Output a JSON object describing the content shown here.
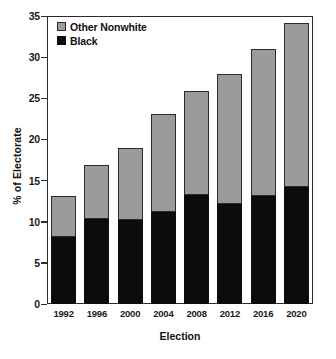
{
  "chart_data": {
    "type": "bar",
    "stacked": true,
    "title": "",
    "xlabel": "Election",
    "ylabel": "% of Electorate",
    "categories": [
      "1992",
      "1996",
      "2000",
      "2004",
      "2008",
      "2012",
      "2016",
      "2020"
    ],
    "series": [
      {
        "name": "Black",
        "color": "#0c0c0c",
        "values": [
          8.2,
          10.3,
          10.2,
          11.2,
          13.2,
          12.2,
          13.1,
          14.2
        ]
      },
      {
        "name": "Other Nonwhite",
        "color": "#9b9b9b",
        "values": [
          4.9,
          6.6,
          8.8,
          11.9,
          12.7,
          15.8,
          17.9,
          19.9
        ]
      }
    ],
    "totals": [
      13.1,
      16.9,
      19.0,
      23.1,
      25.9,
      28.0,
      31.0,
      34.1
    ],
    "ylim": [
      0,
      35
    ],
    "yticks": [
      0,
      5,
      10,
      15,
      20,
      25,
      30,
      35
    ],
    "ytick_labels": [
      "0",
      "5",
      "10",
      "15",
      "20",
      "25",
      "30",
      "35"
    ],
    "grid": false,
    "legend_position": "top-left",
    "legend": [
      "Other Nonwhite",
      "Black"
    ]
  },
  "axes": {
    "y_title": "% of Electorate",
    "x_title": "Election"
  },
  "legend": {
    "items": [
      {
        "label": "Other Nonwhite",
        "swatch": "#9b9b9b"
      },
      {
        "label": "Black",
        "swatch": "#0c0c0c"
      }
    ]
  }
}
